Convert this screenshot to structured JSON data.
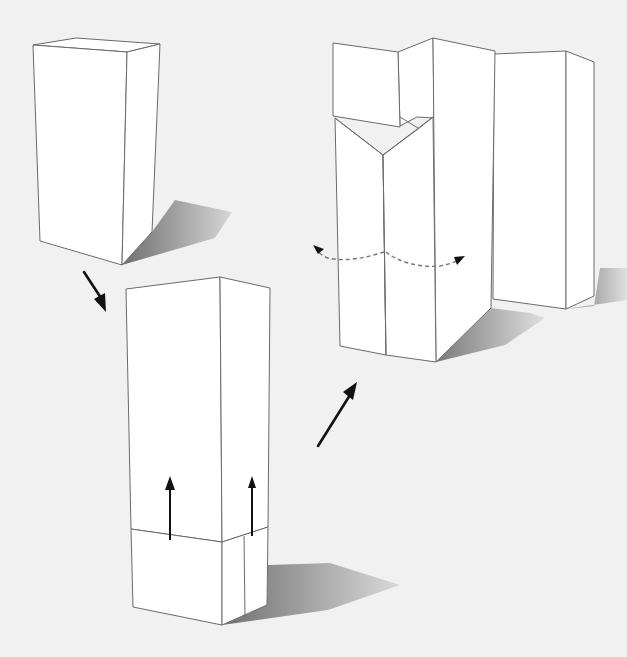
{
  "figure": {
    "background_color": "#f1f1f1",
    "line_color": "#6a6a6a",
    "arrow_color": "#111111",
    "shadow_color": "#8c8c8c",
    "steps": [
      {
        "id": "step-1",
        "label": "closed-box",
        "position": "top-left"
      },
      {
        "id": "step-2",
        "label": "box-with-sleeve-pulled-up",
        "position": "bottom-center"
      },
      {
        "id": "step-3",
        "label": "opened-flaps-with-rotation",
        "position": "top-right"
      }
    ],
    "arrows": [
      {
        "id": "arrow-step1-to-step2",
        "direction": "down-right"
      },
      {
        "id": "arrow-step2-to-step3",
        "direction": "up-right"
      },
      {
        "id": "arrow-pull-up-left",
        "direction": "up"
      },
      {
        "id": "arrow-pull-up-right",
        "direction": "up"
      },
      {
        "id": "arrow-rotate-left",
        "direction": "curved-left",
        "style": "dashed"
      },
      {
        "id": "arrow-rotate-right",
        "direction": "curved-right",
        "style": "dashed"
      }
    ]
  }
}
